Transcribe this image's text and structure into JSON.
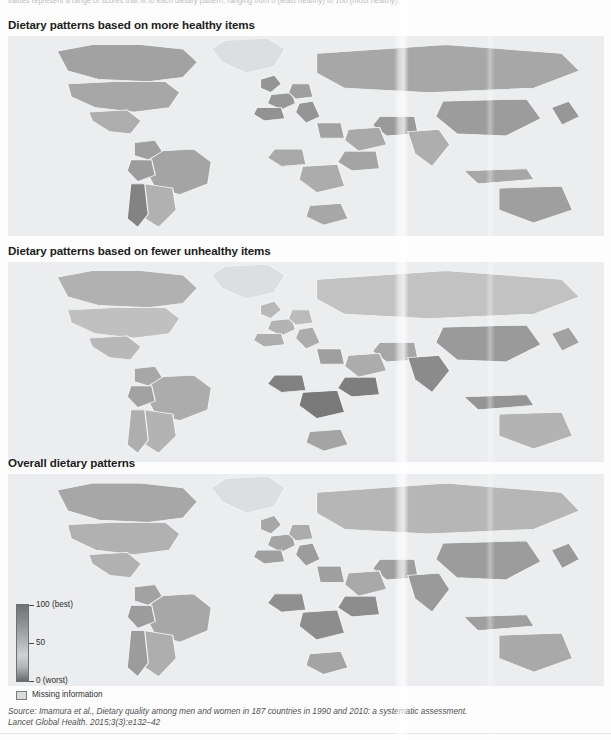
{
  "figure": {
    "intro_note": "values represent a range of scores that fit to each dietary pattern, ranging from 0 (least healthy) to 100 (most healthy).",
    "panels": [
      {
        "id": "more-healthy",
        "title": "Dietary patterns based on more healthy items"
      },
      {
        "id": "fewer-unhealthy",
        "title": "Dietary patterns based on fewer unhealthy items"
      },
      {
        "id": "overall",
        "title": "Overall dietary patterns"
      }
    ],
    "legend": {
      "title": "",
      "ticks": [
        {
          "value": 100,
          "label": "100 (best)"
        },
        {
          "value": 50,
          "label": "50"
        },
        {
          "value": 0,
          "label": "0 (worst)"
        }
      ],
      "missing_label": "Missing information",
      "missing_color": "#d9dcdd",
      "scale_high_color": "#6e7274",
      "scale_mid_color": "#cfd2d3",
      "scale_low_color": "#65696b"
    },
    "source": {
      "line1": "Source: Imamura et al., Dietary quality among men and women in 187 countries in 1990 and 2010: a systematic assessment.",
      "line2": "Lancet Global Health. 2015;3(3):e132–42"
    }
  },
  "chart_data": {
    "type": "heatmap",
    "subtitle": "Three choropleth world maps of dietary pattern scores",
    "colormap": "grayscale",
    "value_range": [
      0,
      100
    ],
    "value_unit": "score",
    "legend_ticks": [
      0,
      50,
      100
    ],
    "legend_position": "bottom-left",
    "grid": false,
    "maps": [
      {
        "name": "Dietary patterns based on more healthy items",
        "regions": [
          {
            "region": "Canada",
            "value": 48
          },
          {
            "region": "United States",
            "value": 44
          },
          {
            "region": "Mexico",
            "value": 38
          },
          {
            "region": "Greenland",
            "value": null
          },
          {
            "region": "Brazil",
            "value": 46
          },
          {
            "region": "Argentina",
            "value": 36
          },
          {
            "region": "Chile",
            "value": 72
          },
          {
            "region": "Peru",
            "value": 52
          },
          {
            "region": "Colombia",
            "value": 50
          },
          {
            "region": "United Kingdom",
            "value": 58
          },
          {
            "region": "France",
            "value": 56
          },
          {
            "region": "Spain",
            "value": 60
          },
          {
            "region": "Germany",
            "value": 50
          },
          {
            "region": "Italy",
            "value": 58
          },
          {
            "region": "Russia",
            "value": 44
          },
          {
            "region": "Nigeria",
            "value": 42
          },
          {
            "region": "Democratic Republic of the Congo",
            "value": 40
          },
          {
            "region": "Ethiopia",
            "value": 46
          },
          {
            "region": "South Africa",
            "value": 44
          },
          {
            "region": "Egypt",
            "value": 48
          },
          {
            "region": "Iran",
            "value": 54
          },
          {
            "region": "Saudi Arabia",
            "value": 42
          },
          {
            "region": "India",
            "value": 38
          },
          {
            "region": "China",
            "value": 52
          },
          {
            "region": "Japan",
            "value": 56
          },
          {
            "region": "Indonesia",
            "value": 44
          },
          {
            "region": "Australia",
            "value": 50
          }
        ]
      },
      {
        "name": "Dietary patterns based on fewer unhealthy items",
        "regions": [
          {
            "region": "Canada",
            "value": 36
          },
          {
            "region": "United States",
            "value": 24
          },
          {
            "region": "Mexico",
            "value": 30
          },
          {
            "region": "Greenland",
            "value": null
          },
          {
            "region": "Brazil",
            "value": 40
          },
          {
            "region": "Argentina",
            "value": 34
          },
          {
            "region": "Chile",
            "value": 38
          },
          {
            "region": "Peru",
            "value": 48
          },
          {
            "region": "Colombia",
            "value": 44
          },
          {
            "region": "United Kingdom",
            "value": 30
          },
          {
            "region": "France",
            "value": 34
          },
          {
            "region": "Spain",
            "value": 38
          },
          {
            "region": "Germany",
            "value": 28
          },
          {
            "region": "Italy",
            "value": 40
          },
          {
            "region": "Russia",
            "value": 22
          },
          {
            "region": "Nigeria",
            "value": 74
          },
          {
            "region": "Democratic Republic of the Congo",
            "value": 80
          },
          {
            "region": "Ethiopia",
            "value": 76
          },
          {
            "region": "South Africa",
            "value": 46
          },
          {
            "region": "Egypt",
            "value": 50
          },
          {
            "region": "Iran",
            "value": 44
          },
          {
            "region": "Saudi Arabia",
            "value": 40
          },
          {
            "region": "India",
            "value": 66
          },
          {
            "region": "China",
            "value": 54
          },
          {
            "region": "Japan",
            "value": 48
          },
          {
            "region": "Indonesia",
            "value": 58
          },
          {
            "region": "Australia",
            "value": 34
          }
        ]
      },
      {
        "name": "Overall dietary patterns",
        "regions": [
          {
            "region": "Canada",
            "value": 44
          },
          {
            "region": "United States",
            "value": 36
          },
          {
            "region": "Mexico",
            "value": 36
          },
          {
            "region": "Greenland",
            "value": null
          },
          {
            "region": "Brazil",
            "value": 44
          },
          {
            "region": "Argentina",
            "value": 38
          },
          {
            "region": "Chile",
            "value": 52
          },
          {
            "region": "Peru",
            "value": 52
          },
          {
            "region": "Colombia",
            "value": 48
          },
          {
            "region": "United Kingdom",
            "value": 44
          },
          {
            "region": "France",
            "value": 46
          },
          {
            "region": "Spain",
            "value": 50
          },
          {
            "region": "Germany",
            "value": 40
          },
          {
            "region": "Italy",
            "value": 52
          },
          {
            "region": "Russia",
            "value": 32
          },
          {
            "region": "Nigeria",
            "value": 62
          },
          {
            "region": "Democratic Republic of the Congo",
            "value": 64
          },
          {
            "region": "Ethiopia",
            "value": 64
          },
          {
            "region": "South Africa",
            "value": 46
          },
          {
            "region": "Egypt",
            "value": 50
          },
          {
            "region": "Iran",
            "value": 50
          },
          {
            "region": "Saudi Arabia",
            "value": 42
          },
          {
            "region": "India",
            "value": 54
          },
          {
            "region": "China",
            "value": 52
          },
          {
            "region": "Japan",
            "value": 54
          },
          {
            "region": "Indonesia",
            "value": 50
          },
          {
            "region": "Australia",
            "value": 42
          }
        ]
      }
    ]
  }
}
